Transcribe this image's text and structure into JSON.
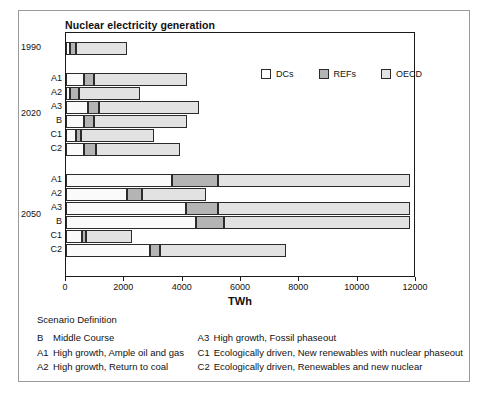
{
  "chart_data": {
    "type": "bar",
    "orientation": "horizontal",
    "stacked": true,
    "title": "Nuclear electricity generation",
    "xlabel": "TWh",
    "ylabel": "",
    "xlim": [
      0,
      12000
    ],
    "xticks": [
      0,
      2000,
      4000,
      6000,
      8000,
      10000,
      12000
    ],
    "xticklabels": [
      "0",
      "2000",
      "4000",
      "6000",
      "8000",
      "10000",
      "12000"
    ],
    "grid": false,
    "legend_position": "upper-right-inside",
    "series": [
      {
        "name": "DCs",
        "color": "#ffffff"
      },
      {
        "name": "REFs",
        "color": "#b4b4b4"
      },
      {
        "name": "OECD",
        "color": "#e2e2e2"
      }
    ],
    "groups": [
      {
        "label": "1990",
        "rows": [
          {
            "scenario": "",
            "DCs": 120,
            "REFs": 230,
            "OECD": 1740,
            "total": 2090
          }
        ]
      },
      {
        "label": "2020",
        "rows": [
          {
            "scenario": "A1",
            "DCs": 620,
            "REFs": 340,
            "OECD": 3190,
            "total": 4150
          },
          {
            "scenario": "A2",
            "DCs": 140,
            "REFs": 310,
            "OECD": 2090,
            "total": 2540
          },
          {
            "scenario": "A3",
            "DCs": 760,
            "REFs": 380,
            "OECD": 3420,
            "total": 4560
          },
          {
            "scenario": "B",
            "DCs": 620,
            "REFs": 340,
            "OECD": 3190,
            "total": 4150
          },
          {
            "scenario": "C1",
            "DCs": 340,
            "REFs": 170,
            "OECD": 2520,
            "total": 3030
          },
          {
            "scenario": "C2",
            "DCs": 620,
            "REFs": 400,
            "OECD": 2880,
            "total": 3900
          }
        ]
      },
      {
        "label": "2050",
        "rows": [
          {
            "scenario": "A1",
            "DCs": 3630,
            "REFs": 1570,
            "OECD": 6590,
            "total": 11790
          },
          {
            "scenario": "A2",
            "DCs": 2090,
            "REFs": 510,
            "OECD": 2200,
            "total": 4800
          },
          {
            "scenario": "A3",
            "DCs": 4110,
            "REFs": 1090,
            "OECD": 6590,
            "total": 11790
          },
          {
            "scenario": "B",
            "DCs": 4460,
            "REFs": 950,
            "OECD": 6380,
            "total": 11790
          },
          {
            "scenario": "C1",
            "DCs": 550,
            "REFs": 140,
            "OECD": 1570,
            "total": 2260
          },
          {
            "scenario": "C2",
            "DCs": 2880,
            "REFs": 340,
            "OECD": 4320,
            "total": 7540
          }
        ]
      }
    ]
  },
  "legend": {
    "items": [
      {
        "label": "DCs",
        "swatch": "dcs"
      },
      {
        "label": "REFs",
        "swatch": "refs"
      },
      {
        "label": "OECD",
        "swatch": "oecd"
      }
    ]
  },
  "scenario_definition": {
    "heading": "Scenario Definition",
    "left": [
      {
        "code": "B",
        "text": "Middle Course"
      },
      {
        "code": "A1",
        "text": "High growth, Ample oil and gas"
      },
      {
        "code": "A2",
        "text": "High growth, Return to coal"
      }
    ],
    "right": [
      {
        "code": "A3",
        "text": "High growth, Fossil phaseout"
      },
      {
        "code": "C1",
        "text": "Ecologically driven, New renewables with nuclear phaseout"
      },
      {
        "code": "C2",
        "text": "Ecologically driven, Renewables and new nuclear"
      }
    ]
  }
}
